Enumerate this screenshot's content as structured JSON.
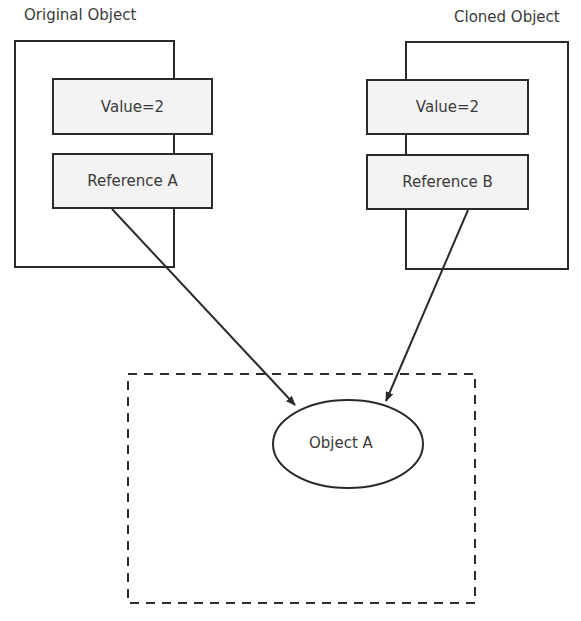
{
  "diagram": {
    "original": {
      "title": "Original Object",
      "value_field": "Value=2",
      "reference_field": "Reference A"
    },
    "cloned": {
      "title": "Cloned Object",
      "value_field": "Value=2",
      "reference_field": "Reference B"
    },
    "target": {
      "label": "Object A"
    },
    "colors": {
      "stroke": "#2a2a2a",
      "field_fill": "#f3f3f3"
    }
  }
}
